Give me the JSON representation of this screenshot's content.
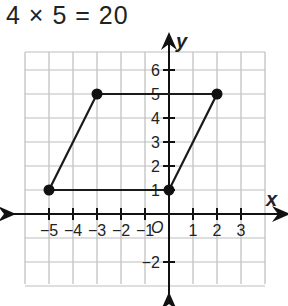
{
  "equation": "4 × 5 = 20",
  "axes": {
    "x_label": "x",
    "y_label": "y",
    "origin_label": "O",
    "x_ticks": [
      "−5",
      "−4",
      "−3",
      "−2",
      "−1",
      "1",
      "2",
      "3"
    ],
    "y_ticks": [
      "6",
      "5",
      "4",
      "3",
      "2",
      "1",
      "−2"
    ]
  },
  "parallelogram": {
    "vertices": [
      [
        -5,
        1
      ],
      [
        -3,
        5
      ],
      [
        2,
        5
      ],
      [
        0,
        1
      ]
    ],
    "stroke": "#1a1a1a"
  },
  "colors": {
    "grid": "#bdbdbd",
    "axis": "#111111",
    "text": "#222222"
  }
}
